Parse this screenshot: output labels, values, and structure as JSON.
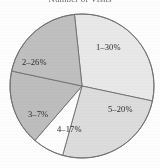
{
  "figure": {
    "title": "Number of Visits",
    "width": 160,
    "height": 168
  },
  "chart_data": {
    "type": "pie",
    "title": "Number of Visits",
    "xlabel": "",
    "ylabel": "",
    "categories": [
      "1",
      "2",
      "3",
      "4",
      "5"
    ],
    "values": [
      30,
      26,
      7,
      17,
      20
    ],
    "value_unit": "%",
    "labels": [
      "1–30%",
      "2–26%",
      "3–7%",
      "4–17%",
      "5–20%"
    ],
    "label_position": "inside",
    "legend": "none",
    "grid": false,
    "start_angle_deg": -96,
    "direction": "clockwise",
    "total": 100,
    "slices": [
      {
        "name": "1",
        "label": "1–30%",
        "value": 30,
        "color": "#e8e8e8",
        "label_x": 96,
        "label_y": 43
      },
      {
        "name": "2",
        "label": "2–26%",
        "value": 26,
        "color": "#dcdcdc",
        "label_x": 22,
        "label_y": 58
      },
      {
        "name": "3",
        "label": "3–7%",
        "value": 7,
        "color": "#fdfdfd",
        "label_x": 28,
        "label_y": 110
      },
      {
        "name": "4",
        "label": "4–17%",
        "value": 17,
        "color": "#bdbdbd",
        "label_x": 57,
        "label_y": 125
      },
      {
        "name": "5",
        "label": "5–20%",
        "value": 20,
        "color": "#bfbfbf",
        "label_x": 108,
        "label_y": 105
      }
    ],
    "geometry": {
      "center_x": 82,
      "center_y": 86,
      "radius": 72,
      "outline_color": "#6e6e6e",
      "outline_width": 0.9
    }
  }
}
